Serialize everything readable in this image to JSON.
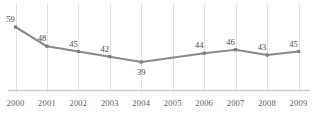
{
  "chart_data": {
    "type": "line",
    "title": "",
    "xlabel": "",
    "ylabel": "",
    "categories": [
      "2000",
      "2001",
      "2002",
      "2003",
      "2004",
      "2005",
      "2006",
      "2007",
      "2008",
      "2009"
    ],
    "values": [
      59,
      48,
      45,
      42,
      39,
      null,
      44,
      46,
      43,
      45
    ],
    "point_labels": [
      "59",
      "48",
      "45",
      "42",
      "39",
      "",
      "44",
      "46",
      "43",
      "45"
    ],
    "label_positions": [
      "above-left",
      "above-left",
      "above-left",
      "above-left",
      "below",
      "",
      "above-left",
      "above-left",
      "above-left",
      "above-left"
    ],
    "ylim": [
      30,
      64
    ],
    "xlim": [
      "2000",
      "2009"
    ],
    "grid": {
      "vertical": true,
      "horizontal": false,
      "color": "#e2e2e2"
    },
    "baseline": {
      "visible": true,
      "color": "#c9c9c9"
    },
    "legend": {
      "visible": false,
      "position": "none"
    },
    "series": [
      {
        "name": "series-1",
        "color": "#8a8a8a",
        "marker": "square",
        "marker_color": "#7d7d7d",
        "values": [
          59,
          48,
          45,
          42,
          39,
          null,
          44,
          46,
          43,
          45
        ]
      }
    ]
  },
  "axis": {
    "x_tick_labels": [
      "2000",
      "2001",
      "2002",
      "2003",
      "2004",
      "2005",
      "2006",
      "2007",
      "2008",
      "2009"
    ]
  },
  "colors": {
    "background": "#ffffff",
    "line": "#8a8a8a",
    "marker": "#7d7d7d",
    "gridline": "#e2e2e2",
    "baseline": "#c9c9c9",
    "tick_text": "#5d5d5d",
    "value_text": "#4a4a4a"
  }
}
